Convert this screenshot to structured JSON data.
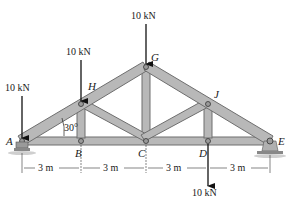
{
  "diagram": {
    "type": "roof-truss",
    "colors": {
      "member_fill": "#b8b8b8",
      "member_stroke": "#6e6e6e",
      "arrow": "#111111",
      "text": "#1a1a1a",
      "ground": "#9a9a9a"
    },
    "joints": {
      "A": {
        "label": "A",
        "x": 22,
        "y": 141
      },
      "B": {
        "label": "B",
        "x": 81,
        "y": 141
      },
      "C": {
        "label": "C",
        "x": 146,
        "y": 141
      },
      "D": {
        "label": "D",
        "x": 208,
        "y": 141
      },
      "E": {
        "label": "E",
        "x": 270,
        "y": 141
      },
      "H": {
        "label": "H",
        "x": 81,
        "y": 104
      },
      "G": {
        "label": "G",
        "x": 146,
        "y": 67
      },
      "J": {
        "label": "J",
        "x": 208,
        "y": 104
      }
    },
    "members": [
      "AB",
      "BC",
      "CD",
      "DE",
      "AH",
      "HG",
      "GJ",
      "JE",
      "BH",
      "HC",
      "CG",
      "CJ",
      "JD"
    ],
    "loads": [
      {
        "joint": "A",
        "label": "10 kN",
        "direction": "down"
      },
      {
        "joint": "H",
        "label": "10 kN",
        "direction": "down"
      },
      {
        "joint": "G",
        "label": "10 kN",
        "direction": "down"
      },
      {
        "joint": "D",
        "label": "10 kN",
        "direction": "down"
      }
    ],
    "angle_label": "30°",
    "dimensions": [
      "3 m",
      "3 m",
      "3 m",
      "3 m"
    ],
    "supports": {
      "A": "pin",
      "E": "pin-on-rocker"
    }
  }
}
